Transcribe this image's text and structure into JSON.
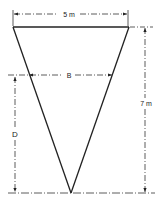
{
  "diagram": {
    "type": "inverted-triangle-tank-cross-section",
    "colors": {
      "stroke": "#222222",
      "background": "#ffffff"
    },
    "labels": {
      "top_width": "5 m",
      "height": "7 m",
      "water_width": "B",
      "water_depth": "D"
    },
    "geometry": {
      "top_width_m": 5,
      "height_m": 7
    }
  }
}
